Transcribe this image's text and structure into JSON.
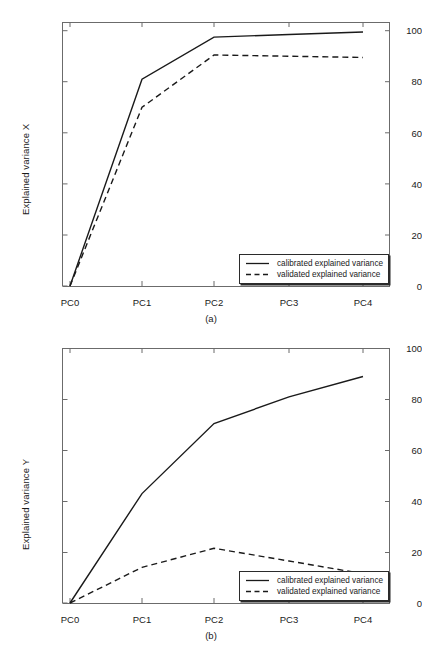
{
  "figures": [
    {
      "id": "a",
      "caption": "(a)",
      "ylabel": "Explained variance X",
      "xticklabels": [
        "PC0",
        "PC1",
        "PC2",
        "PC3",
        "PC4"
      ],
      "yticklabels": [
        "0",
        "20",
        "40",
        "60",
        "80",
        "100"
      ],
      "legend": [
        {
          "label": "calibrated explained variance",
          "style": "solid"
        },
        {
          "label": "validated explained variance",
          "style": "dashed"
        }
      ]
    },
    {
      "id": "b",
      "caption": "(b)",
      "ylabel": "Explained variance Y",
      "xticklabels": [
        "PC0",
        "PC1",
        "PC2",
        "PC3",
        "PC4"
      ],
      "yticklabels": [
        "0",
        "20",
        "40",
        "60",
        "80",
        "100"
      ],
      "legend": [
        {
          "label": "calibrated explained variance",
          "style": "solid"
        },
        {
          "label": "validated explained variance",
          "style": "dashed"
        }
      ]
    }
  ],
  "chart_data": [
    {
      "type": "line",
      "title": "(a)",
      "xlabel": "",
      "ylabel": "Explained variance X",
      "categories": [
        "PC0",
        "PC1",
        "PC2",
        "PC3",
        "PC4"
      ],
      "ylim": [
        0,
        100
      ],
      "yticks": [
        0,
        20,
        40,
        60,
        80,
        100
      ],
      "grid": false,
      "legend_position": "lower-right",
      "series": [
        {
          "name": "calibrated explained variance",
          "style": "solid",
          "color": "#1a1a1a",
          "values": [
            0,
            81,
            97.5,
            98.5,
            99.5
          ]
        },
        {
          "name": "validated explained variance",
          "style": "dashed",
          "color": "#1a1a1a",
          "values": [
            0,
            70,
            90.5,
            90,
            89.5
          ]
        }
      ]
    },
    {
      "type": "line",
      "title": "(b)",
      "xlabel": "",
      "ylabel": "Explained variance Y",
      "categories": [
        "PC0",
        "PC1",
        "PC2",
        "PC3",
        "PC4"
      ],
      "ylim": [
        0,
        100
      ],
      "yticks": [
        0,
        20,
        40,
        60,
        80,
        100
      ],
      "grid": false,
      "legend_position": "lower-right",
      "series": [
        {
          "name": "calibrated explained variance",
          "style": "solid",
          "color": "#1a1a1a",
          "values": [
            0,
            43,
            70.5,
            81,
            89
          ]
        },
        {
          "name": "validated explained variance",
          "style": "dashed",
          "color": "#1a1a1a",
          "values": [
            0,
            14,
            21.5,
            16.5,
            11.5
          ]
        }
      ]
    }
  ]
}
